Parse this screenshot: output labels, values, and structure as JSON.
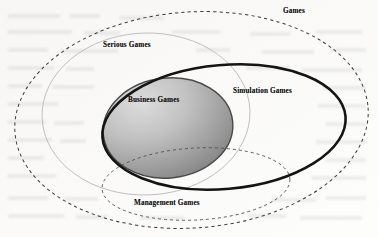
{
  "figure": {
    "kind": "venn-euler-diagram",
    "background_color": "#fbfbfa",
    "width": 378,
    "height": 237
  },
  "sets": [
    {
      "id": "games",
      "label": "Games",
      "outline_style": "dashed",
      "outline_color": "#3a3a3a",
      "fill": "none",
      "cx": 191.5,
      "cy": 120,
      "rx": 177,
      "ry": 108,
      "rotation": -4
    },
    {
      "id": "serious_games",
      "label": "Serious Games",
      "outline_style": "solid-thin",
      "outline_color": "#b9b9bb",
      "fill": "none",
      "cx": 146,
      "cy": 114,
      "rx": 104,
      "ry": 81,
      "rotation": -2
    },
    {
      "id": "simulation_games",
      "label": "Simulation Games",
      "outline_style": "solid-thick",
      "outline_color": "#141414",
      "fill": "none",
      "cx": 224,
      "cy": 127,
      "rx": 122,
      "ry": 62,
      "rotation": -5
    },
    {
      "id": "business_games",
      "label": "Business Games",
      "outline_style": "solid",
      "outline_color": "#4a4a4a",
      "fill": "gradient-gray",
      "fill_from": "#d6d6d6",
      "fill_to": "#7e7e7e",
      "cx": 168,
      "cy": 128,
      "rx": 65,
      "ry": 50,
      "rotation": -6
    },
    {
      "id": "management_games",
      "label": "Management Games",
      "outline_style": "dashed",
      "outline_color": "#4f4f4f",
      "fill": "none",
      "cx": 196,
      "cy": 184,
      "rx": 94,
      "ry": 36,
      "rotation": -3
    }
  ],
  "labels": {
    "games": "Games",
    "serious_games": "Serious Games",
    "simulation_games": "Simulation Games",
    "business_games": "Business Games",
    "management_games": "Management Games"
  }
}
